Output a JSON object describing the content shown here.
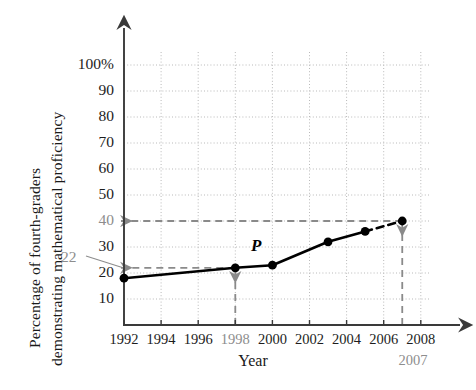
{
  "chart_data": {
    "type": "line",
    "title": "",
    "xlabel": "Year",
    "ylabel_line1": "Percentage of fourth-graders",
    "ylabel_line2": "demonstrating mathematical proficiency",
    "xlim": [
      1992,
      2008
    ],
    "ylim": [
      0,
      105
    ],
    "grid": true,
    "legend": null,
    "x_tick_labels": [
      "1992",
      "1994",
      "1996",
      "1998",
      "2000",
      "2002",
      "2004",
      "2006",
      "2008"
    ],
    "x_tick_values": [
      1992,
      1994,
      1996,
      1998,
      2000,
      2002,
      2004,
      2006,
      2008
    ],
    "x_tick_muted": [
      false,
      false,
      false,
      true,
      false,
      false,
      false,
      false,
      false
    ],
    "y_tick_labels": [
      "100%",
      "90",
      "80",
      "70",
      "60",
      "50",
      "40",
      "30",
      "20",
      "10"
    ],
    "y_tick_values": [
      100,
      90,
      80,
      70,
      60,
      50,
      40,
      30,
      20,
      10
    ],
    "y_tick_muted": [
      false,
      false,
      false,
      false,
      false,
      false,
      true,
      false,
      false,
      false
    ],
    "series": [
      {
        "name": "Percentage of fourth-graders demonstrating mathematical proficiency",
        "x": [
          1992,
          1998,
          2000,
          2003,
          2005,
          2007
        ],
        "values": [
          18,
          22,
          23,
          32,
          36,
          40
        ],
        "marker": "filled-circle",
        "color": "#000000"
      }
    ],
    "dashed_segment": {
      "from_x": 2005,
      "from_y": 36,
      "to_x": 2007,
      "to_y": 40
    },
    "point_label": {
      "text": "P",
      "x": 1998,
      "y": 22
    },
    "annotations": [
      {
        "name": "y-value-22",
        "text": "22",
        "value": 22,
        "color": "#8d8d8d"
      },
      {
        "name": "y-value-40",
        "text": "40",
        "value": 40,
        "color": "#8d8d8d"
      },
      {
        "name": "x-value-2007",
        "text": "2007",
        "value": 2007,
        "color": "#8d8d8d"
      },
      {
        "name": "x-value-1998",
        "text": "1998",
        "value": 1998,
        "color": "#8d8d8d"
      }
    ],
    "guide_lines": [
      {
        "name": "guide-h-22",
        "orientation": "horizontal",
        "y": 22,
        "from_x": 1998,
        "to_x": 1992,
        "arrow": "left"
      },
      {
        "name": "guide-v-1998",
        "orientation": "vertical",
        "x": 1998,
        "from_y": 0,
        "to_y": 22,
        "arrow": "up"
      },
      {
        "name": "guide-h-40",
        "orientation": "horizontal",
        "y": 40,
        "from_x": 2007,
        "to_x": 1992,
        "arrow": "left"
      },
      {
        "name": "guide-v-2007",
        "orientation": "vertical",
        "x": 2007,
        "from_y": 0,
        "to_y": 40,
        "arrow": "up"
      }
    ],
    "colors": {
      "line": "#000000",
      "grid": "#b9b9b9",
      "axis": "#3a3a3a",
      "guide": "#8a8a8a",
      "text": "#1d1d1d",
      "muted_text": "#8d8d8d",
      "background": "#ffffff"
    }
  }
}
